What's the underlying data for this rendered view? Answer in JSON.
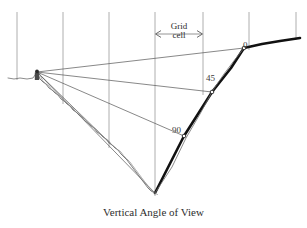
{
  "figure": {
    "caption": "Vertical Angle of View",
    "width": 307,
    "height": 228,
    "background_color": "#ffffff"
  },
  "annotations": {
    "grid_cell_label_line1": "Grid",
    "grid_cell_label_line2": "cell",
    "angle_0": "0",
    "angle_45": "45",
    "angle_90": "90"
  },
  "colors": {
    "grid_line": "#9a9a9a",
    "sight_line": "#555555",
    "terrain_thin": "#6e6e6e",
    "terrain_thick": "#111111",
    "text": "#2b2b2b"
  },
  "chart_data": {
    "type": "line",
    "title": "Vertical Angle of View",
    "xlabel": "",
    "ylabel": "",
    "grid": true,
    "legend": "none",
    "axis_note": "Pixel coordinates of the source figure; y increases downward.",
    "xlim": [
      0,
      307
    ],
    "ylim": [
      228,
      0
    ],
    "grid_lines_x": [
      17,
      63,
      109,
      155,
      203,
      249,
      296
    ],
    "grid_line_top_y": 12,
    "grid_cell_width_px": 46,
    "grid_cell_span_x": [
      155,
      203
    ],
    "grid_cell_marker_y": 34,
    "viewpoint": {
      "x": 37,
      "y": 72,
      "label": "observer"
    },
    "angle_markers": [
      {
        "label": "0",
        "target_x": 244,
        "target_y": 48,
        "text_x": 243,
        "text_y": 41
      },
      {
        "label": "45",
        "target_x": 212,
        "target_y": 92,
        "text_x": 206,
        "text_y": 74
      },
      {
        "label": "90",
        "target_x": 184,
        "target_y": 136,
        "text_x": 172,
        "text_y": 126
      }
    ],
    "series": [
      {
        "name": "terrain-profile-left-plateau",
        "style": "thin",
        "points": [
          [
            8,
            78
          ],
          [
            14,
            79
          ],
          [
            20,
            78
          ],
          [
            27,
            79
          ],
          [
            33,
            78
          ],
          [
            37,
            72
          ]
        ]
      },
      {
        "name": "terrain-profile-left-slope",
        "style": "jagged-thin",
        "points": [
          [
            37,
            72
          ],
          [
            40,
            79
          ],
          [
            43,
            82
          ],
          [
            46,
            84
          ],
          [
            49,
            88
          ],
          [
            52,
            90
          ],
          [
            55,
            93
          ],
          [
            58,
            95
          ],
          [
            61,
            99
          ],
          [
            64,
            101
          ],
          [
            67,
            104
          ],
          [
            70,
            106
          ],
          [
            73,
            110
          ],
          [
            76,
            112
          ],
          [
            79,
            115
          ],
          [
            82,
            117
          ],
          [
            85,
            121
          ],
          [
            88,
            123
          ],
          [
            91,
            126
          ],
          [
            94,
            128
          ],
          [
            97,
            132
          ],
          [
            100,
            134
          ],
          [
            103,
            137
          ],
          [
            106,
            139
          ],
          [
            109,
            143
          ],
          [
            112,
            145
          ],
          [
            115,
            148
          ],
          [
            118,
            150
          ],
          [
            121,
            154
          ],
          [
            124,
            157
          ],
          [
            127,
            160
          ],
          [
            130,
            164
          ],
          [
            133,
            168
          ],
          [
            136,
            172
          ],
          [
            139,
            176
          ],
          [
            142,
            180
          ],
          [
            145,
            184
          ],
          [
            148,
            188
          ],
          [
            151,
            191
          ],
          [
            155,
            193
          ]
        ]
      },
      {
        "name": "terrain-profile-right-slope",
        "style": "thick",
        "points": [
          [
            155,
            193
          ],
          [
            184,
            136
          ],
          [
            212,
            92
          ],
          [
            231,
            68
          ],
          [
            244,
            48
          ]
        ]
      },
      {
        "name": "terrain-profile-right-plateau",
        "style": "thick",
        "points": [
          [
            244,
            48
          ],
          [
            262,
            44
          ],
          [
            280,
            41
          ],
          [
            300,
            38
          ]
        ]
      },
      {
        "name": "terrain-profile-right-thin-overlay",
        "style": "thin",
        "points": [
          [
            155,
            193
          ],
          [
            172,
            167
          ],
          [
            186,
            138
          ],
          [
            200,
            114
          ],
          [
            213,
            90
          ],
          [
            224,
            74
          ],
          [
            233,
            62
          ],
          [
            244,
            48
          ]
        ]
      }
    ],
    "sight_lines": [
      {
        "from": [
          37,
          72
        ],
        "to": [
          244,
          48
        ],
        "angle_label": "0"
      },
      {
        "from": [
          37,
          72
        ],
        "to": [
          212,
          92
        ],
        "angle_label": "45"
      },
      {
        "from": [
          37,
          72
        ],
        "to": [
          184,
          136
        ],
        "angle_label": "90"
      },
      {
        "from": [
          37,
          72
        ],
        "to": [
          155,
          193
        ],
        "angle_label": ""
      },
      {
        "from": [
          37,
          72
        ],
        "to": [
          112,
          145
        ],
        "angle_label": ""
      }
    ]
  }
}
